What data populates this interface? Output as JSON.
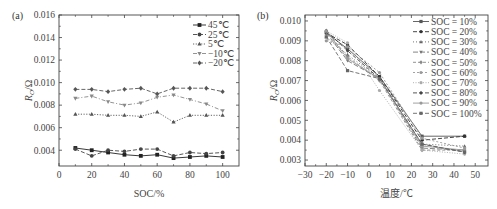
{
  "chart_data": [
    {
      "panel": "(a)",
      "type": "line",
      "title": "",
      "xlabel": "SOC/%",
      "ylabel": "R_O/Ω",
      "xlim": [
        0,
        110
      ],
      "ylim": [
        0.0026,
        0.016
      ],
      "xticks": [
        0,
        20,
        40,
        60,
        80,
        100
      ],
      "xtick_labels": [
        "0",
        "20",
        "40",
        "60",
        "80",
        "100"
      ],
      "yticks": [
        0.004,
        0.006,
        0.008,
        0.01,
        0.012,
        0.014,
        0.016
      ],
      "ytick_labels": [
        "0.004",
        "0.006",
        "0.008",
        "0.010",
        "0.012",
        "0.014",
        "0.016"
      ],
      "grid": false,
      "legend_position": "upper right",
      "x": [
        10,
        20,
        30,
        40,
        50,
        60,
        70,
        80,
        90,
        100
      ],
      "series": [
        {
          "name": "45℃",
          "marker": "square",
          "dash": "solid",
          "color": "#222222",
          "values": [
            0.0042,
            0.004,
            0.0038,
            0.0036,
            0.0035,
            0.0036,
            0.0033,
            0.0034,
            0.0035,
            0.0034
          ]
        },
        {
          "name": "25℃",
          "marker": "circle",
          "dash": "dashed",
          "color": "#444444",
          "values": [
            0.0041,
            0.0035,
            0.004,
            0.0039,
            0.0041,
            0.0041,
            0.0035,
            0.0038,
            0.0037,
            0.0038
          ]
        },
        {
          "name": "5℃",
          "marker": "triangle-up",
          "dash": "dotted",
          "color": "#555555",
          "values": [
            0.0072,
            0.0072,
            0.0071,
            0.0071,
            0.007,
            0.0074,
            0.0065,
            0.0071,
            0.0071,
            0.0071
          ]
        },
        {
          "name": "−10℃",
          "marker": "triangle-down",
          "dash": "dashdot",
          "color": "#888888",
          "values": [
            0.0086,
            0.0088,
            0.0083,
            0.008,
            0.0082,
            0.0087,
            0.0089,
            0.0085,
            0.0081,
            0.0075
          ]
        },
        {
          "name": "−20℃",
          "marker": "diamond",
          "dash": "dashed",
          "color": "#555555",
          "values": [
            0.0094,
            0.0094,
            0.0092,
            0.0094,
            0.0095,
            0.009,
            0.0095,
            0.0095,
            0.0095,
            0.0092
          ]
        }
      ]
    },
    {
      "panel": "(b)",
      "type": "line",
      "title": "",
      "xlabel": "温度/℃",
      "ylabel": "R_O/Ω",
      "xlim": [
        -30,
        56
      ],
      "ylim": [
        0.0027,
        0.0103
      ],
      "xticks": [
        -30,
        -20,
        -10,
        0,
        10,
        20,
        30,
        40,
        50
      ],
      "xtick_labels": [
        "−30",
        "−20",
        "−10",
        "0",
        "10",
        "20",
        "30",
        "40",
        "50"
      ],
      "yticks": [
        0.003,
        0.004,
        0.005,
        0.006,
        0.007,
        0.008,
        0.009,
        0.01
      ],
      "ytick_labels": [
        "0.003",
        "0.004",
        "0.005",
        "0.006",
        "0.007",
        "0.008",
        "0.009",
        "0.010"
      ],
      "grid": false,
      "legend_position": "upper right",
      "x": [
        -20,
        -10,
        5,
        25,
        45
      ],
      "series": [
        {
          "name": "SOC = 10%",
          "color": "#555555",
          "values": [
            0.0094,
            0.0086,
            0.0072,
            0.0042,
            0.0042
          ]
        },
        {
          "name": "SOC = 20%",
          "color": "#333333",
          "values": [
            0.0094,
            0.0088,
            0.0072,
            0.004,
            0.0042
          ]
        },
        {
          "name": "SOC = 30%",
          "color": "#666666",
          "values": [
            0.0092,
            0.0083,
            0.0071,
            0.0038,
            0.0037
          ]
        },
        {
          "name": "SOC = 40%",
          "color": "#777777",
          "values": [
            0.0094,
            0.008,
            0.0071,
            0.0036,
            0.0035
          ]
        },
        {
          "name": "SOC = 50%",
          "color": "#888888",
          "values": [
            0.0095,
            0.0082,
            0.007,
            0.0035,
            0.0035
          ]
        },
        {
          "name": "SOC = 60%",
          "color": "#999999",
          "values": [
            0.009,
            0.0087,
            0.0074,
            0.0041,
            0.0036
          ]
        },
        {
          "name": "SOC = 70%",
          "color": "#aaaaaa",
          "values": [
            0.0095,
            0.0089,
            0.0065,
            0.0035,
            0.0033
          ]
        },
        {
          "name": "SOC = 80%",
          "color": "#444444",
          "values": [
            0.0095,
            0.0085,
            0.0071,
            0.0038,
            0.0034
          ]
        },
        {
          "name": "SOC = 90%",
          "color": "#999999",
          "values": [
            0.0095,
            0.0081,
            0.0071,
            0.0037,
            0.0035
          ]
        },
        {
          "name": "SOC = 100%",
          "color": "#666666",
          "values": [
            0.0092,
            0.0075,
            0.0071,
            0.0038,
            0.0034
          ]
        }
      ]
    }
  ]
}
